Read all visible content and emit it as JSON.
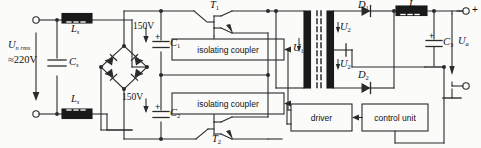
{
  "diagram": {
    "type": "circuit-schematic"
  },
  "input": {
    "source_label": "U",
    "source_sub": "n rms",
    "source_value": "≈220V",
    "filter_cap": "C",
    "filter_cap_sub": "s",
    "inductor_top": "L",
    "inductor_top_sub": "s",
    "inductor_bottom": "L",
    "inductor_bottom_sub": "s"
  },
  "dc_link": {
    "volt_top": "150V",
    "volt_bottom": "150V",
    "cap_top": "C",
    "cap_top_sub": "1",
    "cap_bottom": "C",
    "cap_bottom_sub": "2",
    "polarity": "+"
  },
  "switches": {
    "transistor_top": "T",
    "transistor_top_sub": "1",
    "transistor_bottom": "T",
    "transistor_bottom_sub": "2"
  },
  "blocks": {
    "isolating_coupler_top": "isolating  coupler",
    "isolating_coupler_bottom": "isolating  coupler",
    "driver": "driver",
    "control_unit": "control unit"
  },
  "transformer": {
    "primary_label": "U",
    "primary_sub": "1",
    "secondary_label_top": "U",
    "secondary_top_sub": "2",
    "secondary_label_bottom": "U",
    "secondary_bottom_sub": "2"
  },
  "rectifier": {
    "diode_top": "D",
    "diode_top_sub": "1",
    "diode_bottom": "D",
    "diode_bottom_sub": "2"
  },
  "output": {
    "inductor": "L",
    "cap": "C",
    "cap_sub": "3",
    "cap_polarity": "+",
    "voltage_label": "U",
    "voltage_sub": "a",
    "terminal_plus": "+"
  },
  "colors": {
    "line": "#2b2b2b",
    "fill_dark": "#1a1a1a",
    "background": "#fbfbfa"
  }
}
